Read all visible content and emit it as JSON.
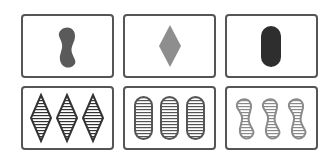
{
  "game": "Set card game",
  "colors": {
    "border": "#555555",
    "dark": "#4a4a4a",
    "mid": "#8a8a8a",
    "light": "#9a9a9a",
    "stripe_dark": "#333333",
    "stripe_mid": "#777777"
  },
  "cards": [
    {
      "position": "row1-col1",
      "count": 1,
      "shape": "squiggle",
      "shading": "solid",
      "color": "#5a5a5a"
    },
    {
      "position": "row1-col2",
      "count": 1,
      "shape": "diamond",
      "shading": "solid",
      "color": "#8e8e8e"
    },
    {
      "position": "row1-col3",
      "count": 1,
      "shape": "oval",
      "shading": "solid",
      "color": "#2e2e2e"
    },
    {
      "position": "row2-col1",
      "count": 3,
      "shape": "diamond",
      "shading": "striped",
      "color": "#333333"
    },
    {
      "position": "row2-col2",
      "count": 3,
      "shape": "oval",
      "shading": "striped",
      "color": "#555555"
    },
    {
      "position": "row2-col3",
      "count": 3,
      "shape": "squiggle",
      "shading": "striped",
      "color": "#8a8a8a"
    }
  ]
}
